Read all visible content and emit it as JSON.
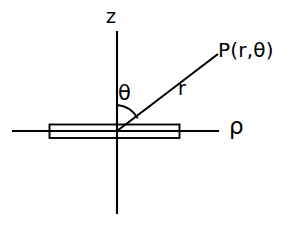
{
  "figure": {
    "background_color": "#ffffff",
    "stroke_color": "#000000",
    "labels": {
      "z_axis": "z",
      "rho_axis": "ρ",
      "theta_angle": "θ",
      "radius": "r",
      "point": "P(r,θ)"
    },
    "geometry": {
      "origin": {
        "x": 117,
        "y": 131
      },
      "z_axis": {
        "x": 117,
        "y_top": 31,
        "y_bottom": 214
      },
      "rho_axis": {
        "y": 131,
        "x_left": 12,
        "x_right": 219
      },
      "ray": {
        "x1": 117,
        "y1": 131,
        "x2": 218,
        "y2": 54
      },
      "slab": {
        "x": 49,
        "y": 124,
        "width": 131,
        "height": 14
      },
      "angle_arc": {
        "radius": 26,
        "start_deg": 90,
        "sweep_to_ray": true
      }
    }
  }
}
